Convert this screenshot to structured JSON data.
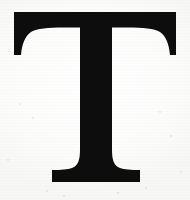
{
  "image": {
    "kind": "scanned-letterform",
    "width": 190,
    "height": 200,
    "caption": "T",
    "character": "T",
    "script": "Latin",
    "case": "uppercase",
    "typeface_style": "serif",
    "serif_class": "bracketed transitional / Didone capital"
  },
  "colors": {
    "ink": "#0d0d0d",
    "ink_edge": "#23231f",
    "paper": "#fcfcfb",
    "paper_highlight": "#ffffff",
    "paper_shadow": "#f5f5f3",
    "speckle": "#78787611"
  },
  "glyph": {
    "label": "letter-T",
    "alt_text": "Black serif capital letter T on off-white scanned paper",
    "bounds": {
      "left": 14,
      "right": 176,
      "top": 12,
      "bottom": 182,
      "cap_width": 162,
      "cap_height": 170
    },
    "crossbar": {
      "left": 14,
      "right": 176,
      "top": 12,
      "thickness": 17,
      "serif_drop_bottom": 55
    },
    "stem": {
      "top_left": 80,
      "top_right": 112,
      "bottom_left": 78,
      "bottom_right": 114,
      "width": 32
    },
    "foot": {
      "left": 52,
      "right": 140,
      "top": 170,
      "bottom": 182,
      "slab_thickness": 12
    }
  },
  "specks": [
    {
      "x": 20,
      "y": 104,
      "r": 1.2
    },
    {
      "x": 33,
      "y": 118,
      "r": 0.9
    },
    {
      "x": 160,
      "y": 112,
      "r": 1.1
    },
    {
      "x": 171,
      "y": 136,
      "r": 0.8
    },
    {
      "x": 47,
      "y": 191,
      "r": 1.0
    },
    {
      "x": 118,
      "y": 193,
      "r": 0.9
    },
    {
      "x": 146,
      "y": 188,
      "r": 1.2
    },
    {
      "x": 64,
      "y": 196,
      "r": 0.8
    },
    {
      "x": 8,
      "y": 160,
      "r": 0.9
    },
    {
      "x": 181,
      "y": 172,
      "r": 1.0
    }
  ]
}
